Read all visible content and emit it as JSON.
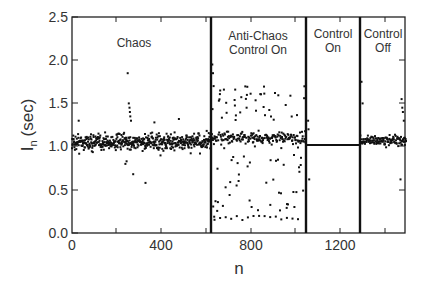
{
  "chart_data": {
    "type": "scatter",
    "title": "",
    "xlabel": "n",
    "ylabel": "I_n (sec)",
    "xlim": [
      0,
      1500
    ],
    "ylim": [
      0.0,
      2.5
    ],
    "xticks": [
      "0",
      "400",
      "800",
      "1200"
    ],
    "yticks": [
      "0.0",
      "0.5",
      "1.0",
      "1.5",
      "2.0",
      "2.5"
    ],
    "grid": false,
    "legend": null,
    "regions": [
      {
        "label": "Chaos",
        "x_start": 0,
        "x_end": 625,
        "description": "interbeat intervals scattered around ~1.05 s (mostly 0.85–1.25), occasional outliers ~0.6–1.85"
      },
      {
        "label": "Anti-Chaos Control On",
        "x_start": 625,
        "x_end": 1050,
        "description": "dense band around ~1.1 s with wide spread from ~0.15 to ~1.95"
      },
      {
        "label": "Control On",
        "x_start": 1050,
        "x_end": 1290,
        "description": "constant interval at ~1.02 s (flat line)"
      },
      {
        "label": "Control Off",
        "x_start": 1290,
        "x_end": 1500,
        "description": "irregular intervals around ~1.05 s, spread 0.6–1.5"
      }
    ],
    "dividers": [
      625,
      1050,
      1290
    ],
    "control_on_level": 1.02
  },
  "labels": {
    "chaos": "Chaos",
    "anti_chaos_1": "Anti-Chaos",
    "anti_chaos_2": "Control On",
    "control_on_1": "Control",
    "control_on_2": "On",
    "control_off_1": "Control",
    "control_off_2": "Off",
    "xlabel": "n",
    "ylabel_main": "I",
    "ylabel_sub": "n",
    "ylabel_unit": "(sec)"
  },
  "colors": {
    "axis": "#222222",
    "points": "#111111"
  }
}
